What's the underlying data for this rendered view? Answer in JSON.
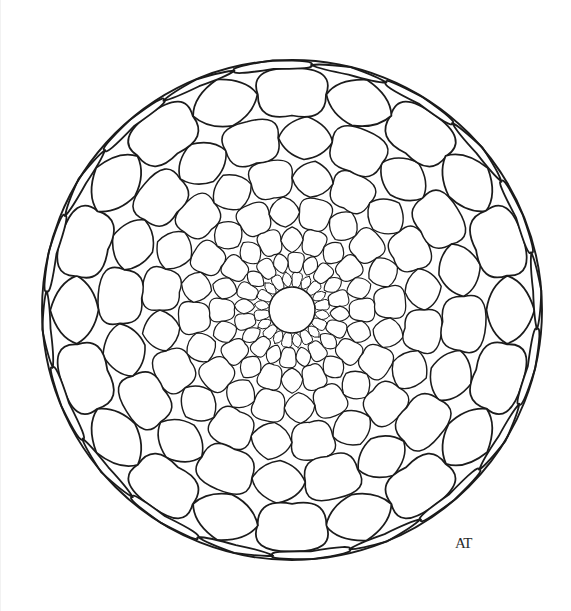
{
  "artwork": {
    "title": "Mandala Coloring Page",
    "medium": "pen-and-ink line drawing",
    "background_color": "#ffffff",
    "ink_color": "#1b1b1b",
    "canvas": {
      "width": 571,
      "height": 611
    }
  },
  "signature": {
    "text": "AT",
    "position": {
      "x": 455,
      "y": 548
    }
  },
  "chart_data": {
    "type": "scatter",
    "xlabel": "",
    "ylabel": "",
    "geometry": {
      "center": {
        "x": 292,
        "y": 310
      },
      "outer_radius": 250,
      "inner_hole_radius": 23,
      "sectors": 20,
      "rings": 8,
      "twist_per_ring_deg": 4.5,
      "ring_radii": [
        23,
        38,
        58,
        83,
        114,
        151,
        194,
        242,
        250
      ],
      "cell_types": [
        "circle",
        "star"
      ],
      "grid": false,
      "legend": "none"
    },
    "series": [
      {
        "name": "ring-0",
        "inner_r": 23,
        "outer_r": 38,
        "cells": 20,
        "start_type": "circle"
      },
      {
        "name": "ring-1",
        "inner_r": 38,
        "outer_r": 58,
        "cells": 20,
        "start_type": "star"
      },
      {
        "name": "ring-2",
        "inner_r": 58,
        "outer_r": 83,
        "cells": 20,
        "start_type": "circle"
      },
      {
        "name": "ring-3",
        "inner_r": 83,
        "outer_r": 114,
        "cells": 20,
        "start_type": "star"
      },
      {
        "name": "ring-4",
        "inner_r": 114,
        "outer_r": 151,
        "cells": 20,
        "start_type": "circle"
      },
      {
        "name": "ring-5",
        "inner_r": 151,
        "outer_r": 194,
        "cells": 20,
        "start_type": "star"
      },
      {
        "name": "ring-6",
        "inner_r": 194,
        "outer_r": 242,
        "cells": 20,
        "start_type": "circle"
      },
      {
        "name": "ring-7",
        "inner_r": 242,
        "outer_r": 250,
        "cells": 20,
        "start_type": "star"
      }
    ]
  }
}
